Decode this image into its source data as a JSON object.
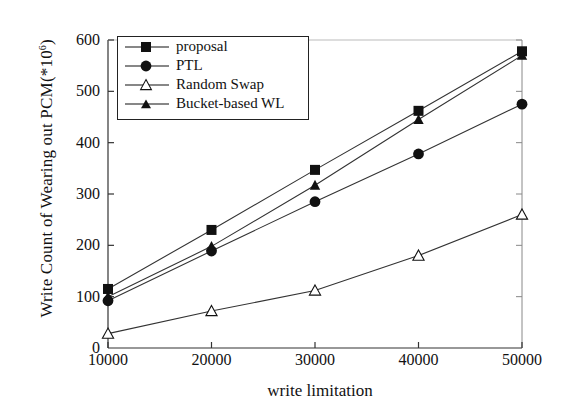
{
  "chart_data": {
    "type": "line",
    "title": "",
    "xlabel": "write limitation",
    "ylabel": "Write Count of Wearing out PCM(*10",
    "ylabel_sup": "6",
    "ylabel_tail": ")",
    "x": [
      10000,
      20000,
      30000,
      40000,
      50000
    ],
    "xtick_labels": [
      "10000",
      "20000",
      "30000",
      "40000",
      "50000"
    ],
    "ytick_labels": [
      "0",
      "100",
      "200",
      "300",
      "400",
      "500",
      "600"
    ],
    "yticks": [
      0,
      100,
      200,
      300,
      400,
      500,
      600
    ],
    "ylim": [
      0,
      600
    ],
    "xlim": [
      10000,
      50000
    ],
    "grid": false,
    "legend_position": "upper-left-inside",
    "series": [
      {
        "name": "proposal",
        "marker": "filled-square",
        "values": [
          115,
          230,
          347,
          462,
          578
        ]
      },
      {
        "name": "PTL",
        "marker": "filled-circle",
        "values": [
          92,
          189,
          285,
          378,
          475
        ]
      },
      {
        "name": "Random Swap",
        "marker": "open-triangle",
        "values": [
          28,
          72,
          112,
          180,
          260
        ]
      },
      {
        "name": "Bucket-based WL",
        "marker": "filled-triangle",
        "values": [
          100,
          198,
          317,
          445,
          570
        ]
      }
    ]
  }
}
